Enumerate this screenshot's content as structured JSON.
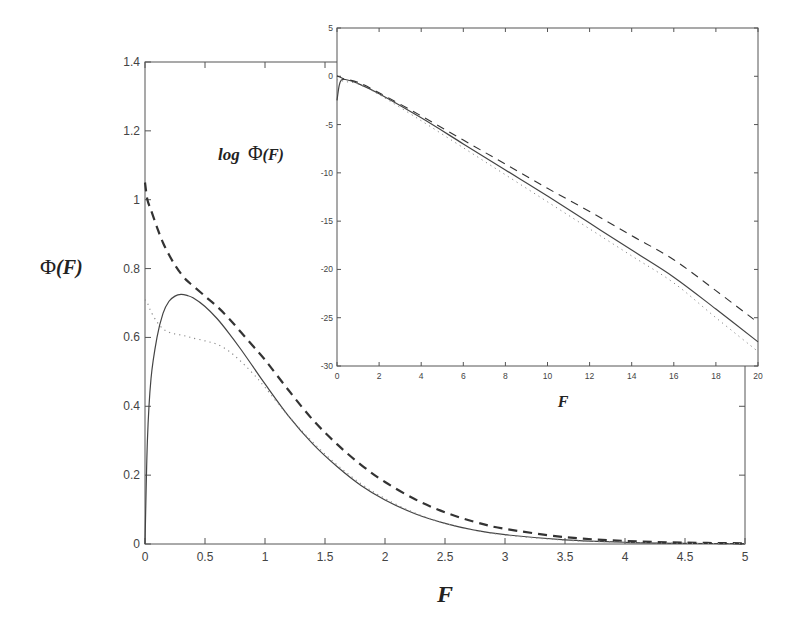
{
  "chart_data": [
    {
      "id": "main",
      "type": "line",
      "title": "",
      "xlabel": "F",
      "ylabel": "Φ(F)",
      "xlim": [
        0,
        5
      ],
      "ylim": [
        0,
        1.4
      ],
      "xticks": [
        "0",
        "0.5",
        "1",
        "1.5",
        "2",
        "2.5",
        "3",
        "3.5",
        "4",
        "4.5",
        "5"
      ],
      "yticks": [
        "0",
        "0.2",
        "0.4",
        "0.6",
        "0.8",
        "1",
        "1.2",
        "1.4"
      ],
      "grid": false,
      "legend": null,
      "x": [
        0,
        0.02,
        0.05,
        0.1,
        0.15,
        0.2,
        0.25,
        0.3,
        0.35,
        0.4,
        0.5,
        0.6,
        0.7,
        0.8,
        0.9,
        1.0,
        1.2,
        1.4,
        1.6,
        1.8,
        2.0,
        2.25,
        2.5,
        2.75,
        3.0,
        3.5,
        4.0,
        4.5,
        5.0
      ],
      "series": [
        {
          "name": "solid",
          "style": "solid",
          "values": [
            0.0,
            0.3,
            0.48,
            0.6,
            0.67,
            0.705,
            0.72,
            0.725,
            0.722,
            0.715,
            0.69,
            0.655,
            0.612,
            0.565,
            0.515,
            0.465,
            0.37,
            0.29,
            0.225,
            0.17,
            0.128,
            0.088,
            0.06,
            0.04,
            0.027,
            0.012,
            0.005,
            0.002,
            0.001
          ]
        },
        {
          "name": "dashed",
          "style": "dashed",
          "values": [
            1.05,
            1.0,
            0.97,
            0.92,
            0.875,
            0.84,
            0.81,
            0.785,
            0.765,
            0.75,
            0.72,
            0.69,
            0.655,
            0.615,
            0.575,
            0.535,
            0.445,
            0.36,
            0.29,
            0.23,
            0.18,
            0.13,
            0.092,
            0.064,
            0.044,
            0.02,
            0.009,
            0.004,
            0.002
          ]
        },
        {
          "name": "dotted",
          "style": "dotted",
          "values": [
            0.71,
            0.7,
            0.675,
            0.645,
            0.625,
            0.615,
            0.61,
            0.607,
            0.603,
            0.598,
            0.59,
            0.58,
            0.56,
            0.53,
            0.495,
            0.455,
            0.37,
            0.295,
            0.23,
            0.175,
            0.132,
            0.09,
            0.06,
            0.04,
            0.026,
            0.011,
            0.005,
            0.002,
            0.001
          ]
        }
      ]
    },
    {
      "id": "inset",
      "type": "line",
      "title": "",
      "xlabel": "F",
      "ylabel": "log Φ(F)",
      "xlim": [
        0,
        20
      ],
      "ylim": [
        -30,
        5
      ],
      "xticks": [
        "0",
        "2",
        "4",
        "6",
        "8",
        "10",
        "12",
        "14",
        "16",
        "18",
        "20"
      ],
      "yticks": [
        "5",
        "0",
        "-5",
        "-10",
        "-15",
        "-20",
        "-25",
        "-30"
      ],
      "grid": false,
      "legend": null,
      "x": [
        0,
        0.1,
        0.2,
        0.4,
        1,
        2,
        4,
        6,
        8,
        10,
        12,
        14,
        16,
        18,
        20
      ],
      "series": [
        {
          "name": "solid",
          "style": "solid",
          "values": [
            -2.5,
            -1.0,
            -0.4,
            -0.33,
            -0.75,
            -1.8,
            -4.3,
            -7.0,
            -9.7,
            -12.4,
            -15.2,
            -18.0,
            -20.8,
            -24.1,
            -27.5
          ]
        },
        {
          "name": "dashed",
          "style": "dashed",
          "values": [
            0.05,
            -0.05,
            -0.15,
            -0.3,
            -0.63,
            -1.7,
            -4.1,
            -6.6,
            -9.1,
            -11.6,
            -14.0,
            -16.5,
            -19.0,
            -22.2,
            -25.5
          ]
        },
        {
          "name": "dotted",
          "style": "dotted",
          "values": [
            -0.35,
            -0.4,
            -0.45,
            -0.55,
            -0.8,
            -1.9,
            -4.6,
            -7.4,
            -10.2,
            -13.0,
            -15.8,
            -18.6,
            -21.4,
            -25.0,
            -28.5
          ]
        }
      ]
    }
  ]
}
